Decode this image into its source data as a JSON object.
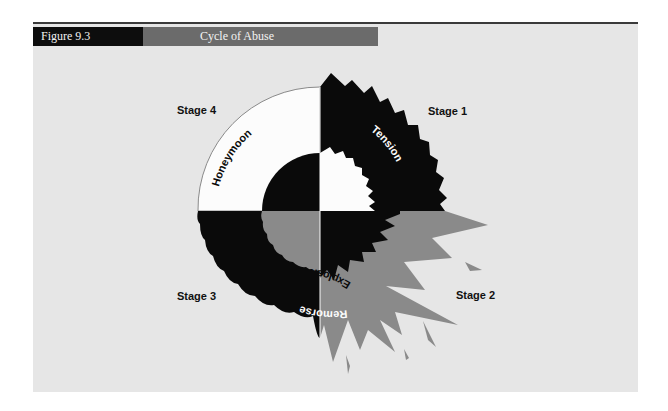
{
  "figure": {
    "number": "Figure 9.3",
    "title": "Cycle of Abuse"
  },
  "colors": {
    "background": "#e6e6e6",
    "black": "#0a0a0a",
    "gray": "#8a8a8a",
    "white": "#fcfcfc",
    "header_dark": "#0d0d0d",
    "header_gray": "#6b6b6b"
  },
  "stages": [
    {
      "stage": "Stage 1",
      "name": "Tension",
      "quadrant": "top-right",
      "fill": "black",
      "edge": "jagged"
    },
    {
      "stage": "Stage 2",
      "name": "Explosion",
      "quadrant": "bottom-right",
      "fill": "gray",
      "edge": "burst"
    },
    {
      "stage": "Stage 3",
      "name": "Remorse",
      "quadrant": "bottom-left",
      "fill": "black",
      "edge": "scalloped"
    },
    {
      "stage": "Stage 4",
      "name": "Honeymoon",
      "quadrant": "top-left",
      "fill": "white",
      "edge": "smooth"
    }
  ],
  "labels": {
    "stage1": "Stage 1",
    "stage2": "Stage 2",
    "stage3": "Stage 3",
    "stage4": "Stage 4",
    "tension": "Tension",
    "explosion": "Explosion",
    "remorse": "Remorse",
    "honeymoon": "Honeymoon"
  }
}
